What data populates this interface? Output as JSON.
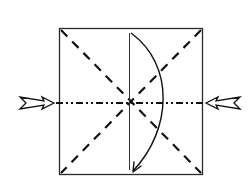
{
  "diagram": {
    "type": "origami-fold-diagram",
    "description": "Square paper with diagonal valley-fold creases, a horizontal mountain-fold line, a vertical center line, a curved fold arrow and two push-in arrows from left and right",
    "colors": {
      "line": "#1a1a1a",
      "background": "#ffffff"
    },
    "paper": {
      "x": 59,
      "y": 28,
      "width": 144,
      "height": 147
    },
    "creases": [
      {
        "name": "diagonal-1",
        "style": "dashed",
        "x1": 60,
        "y1": 29,
        "x2": 202,
        "y2": 174
      },
      {
        "name": "diagonal-2",
        "style": "dashed",
        "x1": 202,
        "y1": 29,
        "x2": 60,
        "y2": 174
      },
      {
        "name": "horizontal",
        "style": "dash-dot-dot",
        "x1": 55,
        "y1": 103,
        "x2": 206,
        "y2": 103
      },
      {
        "name": "vertical-center",
        "style": "solid-thin",
        "x1": 129,
        "y1": 33,
        "x2": 129,
        "y2": 170
      }
    ],
    "arrows": [
      {
        "name": "fold-arrow",
        "kind": "curved",
        "from": [
          131,
          33
        ],
        "to": [
          133,
          172
        ]
      },
      {
        "name": "push-arrow-left",
        "kind": "push",
        "direction": "right",
        "tip": [
          54,
          103
        ]
      },
      {
        "name": "push-arrow-right",
        "kind": "push",
        "direction": "left",
        "tip": [
          207,
          103
        ]
      }
    ]
  }
}
